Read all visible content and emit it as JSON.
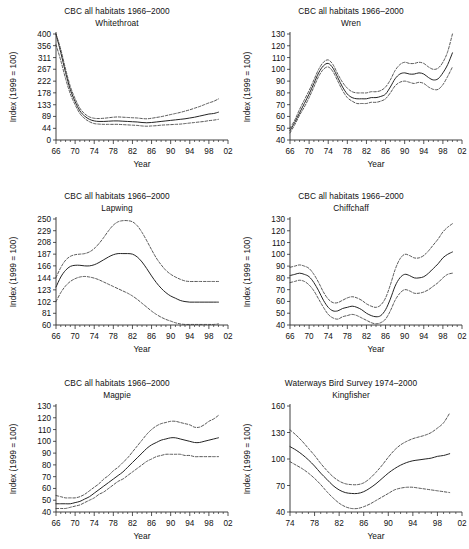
{
  "figure": {
    "panel_count": 6,
    "axis_titles": {
      "x": "Year",
      "y": "Index (1999 = 100)"
    }
  },
  "chart_data": [
    {
      "type": "line",
      "title": "CBC all habitats 1966–2000",
      "subtitle": "Whitethroat",
      "xlabel": "Year",
      "ylabel": "Index (1999 = 100)",
      "xlim": [
        66,
        102
      ],
      "ylim": [
        0,
        400
      ],
      "xticks": [
        "66",
        "70",
        "74",
        "78",
        "82",
        "86",
        "90",
        "94",
        "98",
        "02"
      ],
      "xtick_values": [
        66,
        70,
        74,
        78,
        82,
        86,
        90,
        94,
        98,
        102
      ],
      "yticks": [
        0,
        44,
        89,
        133,
        178,
        222,
        267,
        311,
        356,
        400
      ],
      "grid": false,
      "legend": "none",
      "x": [
        66,
        67,
        68,
        69,
        70,
        71,
        72,
        73,
        74,
        75,
        76,
        77,
        78,
        79,
        80,
        81,
        82,
        83,
        84,
        85,
        86,
        87,
        88,
        89,
        90,
        91,
        92,
        93,
        94,
        95,
        96,
        97,
        98,
        99,
        100
      ],
      "series": [
        {
          "name": "index",
          "values": [
            400,
            330,
            255,
            190,
            145,
            110,
            90,
            78,
            72,
            70,
            70,
            71,
            72,
            72,
            71,
            70,
            69,
            68,
            66,
            65,
            66,
            68,
            70,
            72,
            74,
            76,
            78,
            80,
            83,
            86,
            90,
            94,
            98,
            100,
            105
          ]
        },
        {
          "name": "upper_confidence_limit",
          "values": [
            400,
            342,
            268,
            202,
            156,
            120,
            99,
            87,
            82,
            81,
            82,
            84,
            86,
            87,
            86,
            85,
            84,
            83,
            81,
            80,
            82,
            85,
            88,
            92,
            96,
            100,
            104,
            109,
            114,
            120,
            126,
            133,
            140,
            146,
            155
          ]
        },
        {
          "name": "lower_confidence_limit",
          "values": [
            360,
            300,
            232,
            174,
            133,
            100,
            81,
            69,
            62,
            60,
            59,
            59,
            59,
            59,
            58,
            57,
            56,
            55,
            53,
            52,
            53,
            54,
            56,
            57,
            58,
            59,
            60,
            62,
            64,
            66,
            68,
            70,
            73,
            75,
            78
          ]
        }
      ]
    },
    {
      "type": "line",
      "title": "CBC all habitats 1966–2000",
      "subtitle": "Wren",
      "xlabel": "Year",
      "ylabel": "Index (1999 = 100)",
      "xlim": [
        66,
        102
      ],
      "ylim": [
        40,
        130
      ],
      "xticks": [
        "66",
        "70",
        "74",
        "78",
        "82",
        "86",
        "90",
        "94",
        "98",
        "02"
      ],
      "xtick_values": [
        66,
        70,
        74,
        78,
        82,
        86,
        90,
        94,
        98,
        102
      ],
      "yticks": [
        40,
        50,
        60,
        70,
        80,
        90,
        100,
        110,
        120,
        130
      ],
      "grid": false,
      "legend": "none",
      "x": [
        66,
        67,
        68,
        69,
        70,
        71,
        72,
        73,
        74,
        75,
        76,
        77,
        78,
        79,
        80,
        81,
        82,
        83,
        84,
        85,
        86,
        87,
        88,
        89,
        90,
        91,
        92,
        93,
        94,
        95,
        96,
        97,
        98,
        99,
        100
      ],
      "series": [
        {
          "name": "index",
          "values": [
            48,
            55,
            63,
            71,
            79,
            88,
            97,
            103,
            105,
            101,
            93,
            85,
            79,
            76,
            75,
            75,
            75,
            76,
            76,
            77,
            79,
            85,
            92,
            96,
            97,
            96,
            96,
            97,
            96,
            93,
            91,
            92,
            97,
            104,
            114
          ]
        },
        {
          "name": "upper_confidence_limit",
          "values": [
            50,
            57,
            66,
            74,
            82,
            91,
            100,
            106,
            108,
            104,
            96,
            89,
            84,
            81,
            80,
            80,
            80,
            81,
            81,
            82,
            85,
            91,
            99,
            104,
            106,
            105,
            105,
            106,
            105,
            102,
            100,
            101,
            106,
            115,
            130
          ]
        },
        {
          "name": "lower_confidence_limit",
          "values": [
            46,
            53,
            61,
            68,
            76,
            85,
            94,
            100,
            102,
            98,
            90,
            82,
            76,
            73,
            71,
            71,
            71,
            72,
            72,
            73,
            75,
            80,
            86,
            89,
            90,
            89,
            88,
            89,
            88,
            85,
            83,
            83,
            87,
            94,
            102
          ]
        }
      ]
    },
    {
      "type": "line",
      "title": "CBC all habitats 1966–2000",
      "subtitle": "Lapwing",
      "xlabel": "Year",
      "ylabel": "Index (1999 = 100)",
      "xlim": [
        66,
        102
      ],
      "ylim": [
        60,
        250
      ],
      "xticks": [
        "66",
        "70",
        "74",
        "78",
        "82",
        "86",
        "90",
        "94",
        "98",
        "02"
      ],
      "xtick_values": [
        66,
        70,
        74,
        78,
        82,
        86,
        90,
        94,
        98,
        102
      ],
      "yticks": [
        60,
        81,
        102,
        123,
        144,
        166,
        187,
        208,
        229,
        250
      ],
      "grid": false,
      "legend": "none",
      "x": [
        66,
        67,
        68,
        69,
        70,
        71,
        72,
        73,
        74,
        75,
        76,
        77,
        78,
        79,
        80,
        81,
        82,
        83,
        84,
        85,
        86,
        87,
        88,
        89,
        90,
        91,
        92,
        93,
        94,
        95,
        96,
        97,
        98,
        99,
        100
      ],
      "series": [
        {
          "name": "index",
          "values": [
            128,
            146,
            158,
            165,
            167,
            167,
            166,
            166,
            168,
            172,
            177,
            182,
            186,
            188,
            188,
            188,
            187,
            182,
            173,
            161,
            148,
            136,
            126,
            118,
            112,
            108,
            104,
            102,
            101,
            101,
            101,
            101,
            101,
            101,
            101
          ]
        },
        {
          "name": "upper_confidence_limit",
          "values": [
            145,
            163,
            176,
            183,
            186,
            187,
            188,
            191,
            197,
            206,
            217,
            229,
            239,
            245,
            247,
            247,
            245,
            238,
            226,
            211,
            195,
            180,
            168,
            158,
            151,
            146,
            142,
            139,
            138,
            138,
            138,
            138,
            138,
            138,
            138
          ]
        },
        {
          "name": "lower_confidence_limit",
          "values": [
            102,
            118,
            130,
            138,
            143,
            146,
            147,
            146,
            144,
            141,
            137,
            133,
            129,
            125,
            121,
            117,
            112,
            106,
            99,
            92,
            85,
            79,
            74,
            70,
            67,
            64,
            62,
            61,
            61,
            61,
            61,
            61,
            61,
            61,
            62
          ]
        }
      ]
    },
    {
      "type": "line",
      "title": "CBC all habitats 1966–2000",
      "subtitle": "Chiffchaff",
      "xlabel": "Year",
      "ylabel": "Index (1999 = 100)",
      "xlim": [
        66,
        102
      ],
      "ylim": [
        40,
        130
      ],
      "xticks": [
        "66",
        "70",
        "74",
        "78",
        "82",
        "86",
        "90",
        "94",
        "98",
        "02"
      ],
      "xtick_values": [
        66,
        70,
        74,
        78,
        82,
        86,
        90,
        94,
        98,
        102
      ],
      "yticks": [
        40,
        50,
        60,
        70,
        80,
        90,
        100,
        110,
        120,
        130
      ],
      "grid": false,
      "legend": "none",
      "x": [
        66,
        67,
        68,
        69,
        70,
        71,
        72,
        73,
        74,
        75,
        76,
        77,
        78,
        79,
        80,
        81,
        82,
        83,
        84,
        85,
        86,
        87,
        88,
        89,
        90,
        91,
        92,
        93,
        94,
        95,
        96,
        97,
        98,
        99,
        100
      ],
      "series": [
        {
          "name": "index",
          "values": [
            82,
            83,
            84,
            83,
            81,
            76,
            69,
            61,
            55,
            52,
            52,
            54,
            55,
            56,
            55,
            53,
            50,
            48,
            47,
            48,
            53,
            62,
            73,
            80,
            83,
            82,
            80,
            80,
            81,
            84,
            88,
            92,
            97,
            100,
            102
          ]
        },
        {
          "name": "upper_confidence_limit",
          "values": [
            89,
            90,
            91,
            90,
            88,
            83,
            76,
            68,
            62,
            59,
            59,
            61,
            63,
            64,
            63,
            61,
            58,
            56,
            55,
            57,
            63,
            74,
            87,
            96,
            100,
            99,
            97,
            97,
            99,
            103,
            108,
            113,
            119,
            123,
            126
          ]
        },
        {
          "name": "lower_confidence_limit",
          "values": [
            76,
            77,
            78,
            77,
            74,
            69,
            62,
            55,
            49,
            46,
            45,
            47,
            48,
            49,
            48,
            46,
            44,
            42,
            41,
            42,
            45,
            52,
            61,
            67,
            70,
            69,
            67,
            67,
            68,
            70,
            73,
            76,
            80,
            83,
            84
          ]
        }
      ]
    },
    {
      "type": "line",
      "title": "CBC all habitats 1966–2000",
      "subtitle": "Magpie",
      "xlabel": "Year",
      "ylabel": "Index (1999 = 100)",
      "xlim": [
        66,
        102
      ],
      "ylim": [
        40,
        130
      ],
      "xticks": [
        "66",
        "70",
        "74",
        "78",
        "82",
        "86",
        "90",
        "94",
        "98",
        "02"
      ],
      "xtick_values": [
        66,
        70,
        74,
        78,
        82,
        86,
        90,
        94,
        98,
        102
      ],
      "yticks": [
        40,
        50,
        60,
        70,
        80,
        90,
        100,
        110,
        120,
        130
      ],
      "grid": false,
      "legend": "none",
      "x": [
        66,
        67,
        68,
        69,
        70,
        71,
        72,
        73,
        74,
        75,
        76,
        77,
        78,
        79,
        80,
        81,
        82,
        83,
        84,
        85,
        86,
        87,
        88,
        89,
        90,
        91,
        92,
        93,
        94,
        95,
        96,
        97,
        98,
        99,
        100
      ],
      "series": [
        {
          "name": "index",
          "values": [
            47,
            47,
            47,
            47,
            48,
            49,
            51,
            53,
            56,
            59,
            62,
            65,
            68,
            71,
            74,
            78,
            82,
            86,
            90,
            94,
            97,
            99,
            101,
            102,
            103,
            103,
            102,
            101,
            100,
            99,
            99,
            100,
            101,
            102,
            103
          ]
        },
        {
          "name": "upper_confidence_limit",
          "values": [
            54,
            53,
            52,
            52,
            52,
            53,
            55,
            58,
            61,
            64,
            68,
            71,
            75,
            78,
            82,
            86,
            91,
            96,
            101,
            106,
            110,
            113,
            115,
            116,
            117,
            117,
            116,
            115,
            114,
            112,
            112,
            114,
            117,
            119,
            122
          ]
        },
        {
          "name": "lower_confidence_limit",
          "values": [
            43,
            43,
            43,
            44,
            45,
            46,
            48,
            50,
            52,
            55,
            57,
            60,
            63,
            66,
            68,
            71,
            74,
            77,
            80,
            83,
            85,
            87,
            88,
            89,
            89,
            89,
            89,
            88,
            88,
            87,
            87,
            87,
            87,
            87,
            87
          ]
        }
      ]
    },
    {
      "type": "line",
      "title": "Waterways Bird Survey 1974–2000",
      "subtitle": "Kingfisher",
      "xlabel": "Year",
      "ylabel": "Index (1999 = 100)",
      "xlim": [
        74,
        102
      ],
      "ylim": [
        40,
        160
      ],
      "xticks": [
        "74",
        "78",
        "82",
        "86",
        "90",
        "94",
        "98",
        "02"
      ],
      "xtick_values": [
        74,
        78,
        82,
        86,
        90,
        94,
        98,
        102
      ],
      "yticks": [
        40,
        70,
        100,
        130,
        160
      ],
      "grid": false,
      "legend": "none",
      "x": [
        74,
        75,
        76,
        77,
        78,
        79,
        80,
        81,
        82,
        83,
        84,
        85,
        86,
        87,
        88,
        89,
        90,
        91,
        92,
        93,
        94,
        95,
        96,
        97,
        98,
        99,
        100
      ],
      "series": [
        {
          "name": "index",
          "values": [
            114,
            110,
            105,
            99,
            92,
            84,
            77,
            70,
            65,
            62,
            61,
            61,
            63,
            67,
            72,
            78,
            84,
            89,
            93,
            96,
            98,
            99,
            100,
            101,
            103,
            104,
            106
          ]
        },
        {
          "name": "upper_confidence_limit",
          "values": [
            133,
            127,
            120,
            112,
            104,
            95,
            87,
            80,
            75,
            72,
            71,
            71,
            73,
            78,
            85,
            93,
            102,
            110,
            116,
            120,
            123,
            125,
            127,
            130,
            135,
            141,
            152
          ]
        },
        {
          "name": "lower_confidence_limit",
          "values": [
            97,
            93,
            89,
            84,
            78,
            71,
            63,
            56,
            50,
            46,
            44,
            44,
            46,
            49,
            53,
            57,
            61,
            65,
            67,
            68,
            68,
            67,
            66,
            65,
            64,
            63,
            62
          ]
        }
      ]
    }
  ]
}
